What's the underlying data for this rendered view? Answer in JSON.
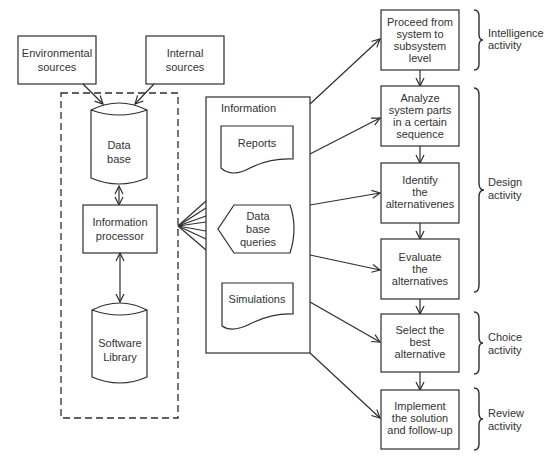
{
  "sources": {
    "environmental": [
      "Environmental",
      "sources"
    ],
    "internal": [
      "Internal",
      "sources"
    ]
  },
  "dss_core": {
    "database": [
      "Data",
      "base"
    ],
    "processor": [
      "Information",
      "processor"
    ],
    "software_library": [
      "Software",
      "Library"
    ]
  },
  "information": {
    "title": "Information",
    "reports": "Reports",
    "queries": [
      "Data",
      "base",
      "queries"
    ],
    "simulations": "Simulations"
  },
  "steps": [
    {
      "lines": [
        "Proceed from",
        "system to",
        "subsystem",
        "level"
      ]
    },
    {
      "lines": [
        "Analyze",
        "system parts",
        "in a certain",
        "sequence"
      ]
    },
    {
      "lines": [
        "Identify",
        "the",
        "alternativenes"
      ]
    },
    {
      "lines": [
        "Evaluate",
        "the",
        "alternatives"
      ]
    },
    {
      "lines": [
        "Select the",
        "best",
        "alternative"
      ]
    },
    {
      "lines": [
        "Implement",
        "the solution",
        "and follow-up"
      ]
    }
  ],
  "activities": [
    {
      "lines": [
        "Intelligence",
        "activity"
      ]
    },
    {
      "lines": [
        "Design",
        "activity"
      ]
    },
    {
      "lines": [
        "Choice",
        "activity"
      ]
    },
    {
      "lines": [
        "Review",
        "activity"
      ]
    }
  ],
  "colors": {
    "line": "#2e2e2e",
    "text": "#333333",
    "background": "#ffffff"
  }
}
